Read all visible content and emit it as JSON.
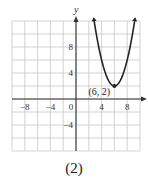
{
  "chart_data": {
    "type": "line",
    "title": "",
    "caption": "(2)",
    "xlabel": "x",
    "ylabel": "y",
    "xlim": [
      -10,
      10
    ],
    "ylim": [
      -8,
      12
    ],
    "grid": true,
    "grid_step": 2,
    "x_ticks": [
      -8,
      -4,
      0,
      4,
      8
    ],
    "y_ticks": [
      8,
      4,
      -4
    ],
    "series": [
      {
        "name": "parabola",
        "equation": "y = (x - 6)^2 + 2",
        "vertex": [
          6,
          2
        ],
        "arrows_both_ends": true,
        "x_range": [
          2.84,
          9.16
        ]
      }
    ],
    "annotations": [
      {
        "text": "(6, 2)",
        "x": 6,
        "y": 2
      }
    ]
  },
  "labels": {
    "x_axis": "x",
    "y_axis": "y",
    "vertex": "(6, 2)",
    "caption": "(2)",
    "tick_x": [
      "−8",
      "−4",
      "0",
      "4",
      "8"
    ],
    "tick_y": [
      "8",
      "4",
      "−4"
    ]
  }
}
